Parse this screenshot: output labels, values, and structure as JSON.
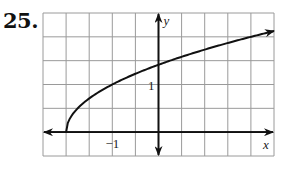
{
  "problem_number": "25.",
  "chart_data": {
    "type": "line",
    "title": "",
    "function": "y = sqrt(x + 2)",
    "xlabel": "x",
    "ylabel": "y",
    "xlim": [
      -2.5,
      2.5
    ],
    "ylim": [
      -0.5,
      2.5
    ],
    "grid": true,
    "grid_step": 0.5,
    "tick_labels": [
      {
        "axis": "x",
        "value": -1,
        "text": "−1"
      },
      {
        "axis": "y",
        "value": 1,
        "text": "1"
      }
    ],
    "series": [
      {
        "name": "curve",
        "start_point": [
          -2,
          0
        ],
        "x": [
          -2,
          -1.75,
          -1.5,
          -1,
          -0.5,
          0,
          0.5,
          1,
          1.5,
          2,
          2.5
        ],
        "y": [
          0,
          0.5,
          0.71,
          1,
          1.22,
          1.41,
          1.58,
          1.73,
          1.87,
          2,
          2.12
        ],
        "arrow_end": true
      }
    ],
    "colors": {
      "curve": "#111111",
      "grid": "#9a9a9a",
      "axis": "#111111"
    }
  }
}
